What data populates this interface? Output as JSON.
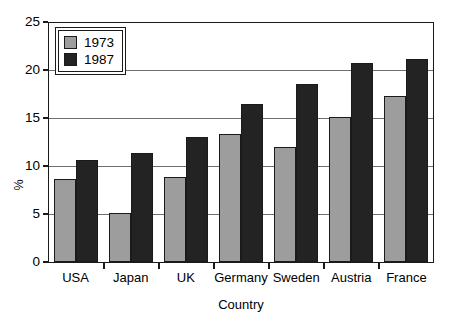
{
  "chart_data": {
    "type": "bar",
    "title": "",
    "subtitle": "",
    "xlabel": "Country",
    "ylabel": "%",
    "categories": [
      "USA",
      "Japan",
      "UK",
      "Germany",
      "Sweden",
      "Austria",
      "France"
    ],
    "series": [
      {
        "name": "1973",
        "color": "#9d9d9d",
        "values": [
          8.7,
          5.2,
          8.9,
          13.4,
          12.1,
          15.2,
          17.4
        ]
      },
      {
        "name": "1987",
        "color": "#232323",
        "values": [
          10.7,
          11.5,
          13.1,
          16.6,
          18.7,
          20.9,
          21.3
        ]
      }
    ],
    "ylim": [
      0,
      25
    ],
    "yticks": [
      0,
      5,
      10,
      15,
      20,
      25
    ],
    "ytick_labels": [
      "0",
      "5",
      "10",
      "15",
      "20",
      "25"
    ],
    "grid": true,
    "grid_axis": "y",
    "legend": {
      "position": "top-left-inside",
      "entries": [
        "1973",
        "1987"
      ]
    },
    "bar_border_color": "#1a1a1a",
    "frame_color": "#1a1a1a",
    "background": "#ffffff"
  }
}
